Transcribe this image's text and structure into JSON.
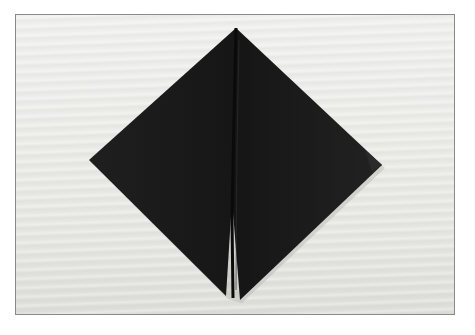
{
  "image": {
    "description": "Folded black napkin on light wooden surface",
    "subject": "black cloth napkin folded into a diamond shape with a center fold",
    "colors": {
      "napkin": "#1c1c1c",
      "napkin_shadow": "#0d0d0d",
      "surface": "#e8e8e5",
      "frame_border": "#8a8a8a"
    }
  }
}
